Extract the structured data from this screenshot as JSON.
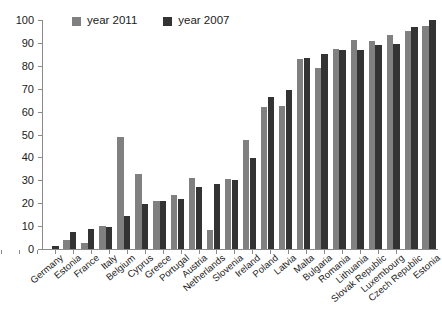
{
  "chart_data": {
    "type": "bar",
    "title": "",
    "subtitle": "",
    "xlabel": "",
    "ylabel": "",
    "ylim": [
      0,
      100
    ],
    "yticks": [
      0,
      10,
      20,
      30,
      40,
      50,
      60,
      70,
      80,
      90,
      100
    ],
    "grid": false,
    "legend_position": "top-left",
    "categories": [
      "Germany",
      "Estonia",
      "France",
      "Italy",
      "Belgium",
      "Cyprus",
      "Greece",
      "Portugal",
      "Austria",
      "Netherlands",
      "Slovenia",
      "Ireland",
      "Poland",
      "Latvia",
      "Malta",
      "Bulgaria",
      "Romania",
      "Lithuania",
      "Slovak Republic",
      "Luxembourg",
      "Czech Republic",
      "Estonia"
    ],
    "series": [
      {
        "name": "year 2011",
        "color": "#808080",
        "values": [
          0.0,
          3.9,
          2.6,
          10.0,
          48.7,
          32.7,
          21.0,
          23.8,
          31.0,
          8.5,
          30.7,
          47.7,
          62.1,
          62.3,
          82.8,
          79.0,
          87.3,
          91.4,
          90.7,
          93.5,
          95.2,
          97.2
        ]
      },
      {
        "name": "year 2007",
        "color": "#333333",
        "values": [
          1.1,
          7.3,
          8.6,
          9.4,
          14.5,
          19.5,
          20.8,
          21.7,
          26.9,
          28.2,
          30.2,
          39.7,
          66.2,
          69.4,
          83.6,
          85.2,
          86.7,
          87.1,
          89.3,
          89.4,
          97.0,
          99.8
        ]
      }
    ]
  },
  "legend": {
    "entries": [
      {
        "label": "year 2011",
        "color": "#808080"
      },
      {
        "label": "year 2007",
        "color": "#333333"
      }
    ]
  },
  "axis": {
    "y_tick_labels": [
      "0",
      "10",
      "20",
      "30",
      "40",
      "50",
      "60",
      "70",
      "80",
      "90",
      "100"
    ]
  }
}
